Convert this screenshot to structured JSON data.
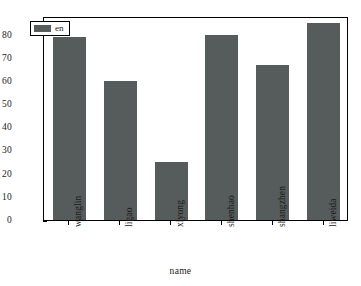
{
  "chart_data": {
    "type": "bar",
    "title": "",
    "xlabel": "name",
    "ylabel": "",
    "categories": [
      "wanglin",
      "ligao",
      "xiyong",
      "shenhao",
      "shangzhen",
      "liweida"
    ],
    "values": [
      79,
      60,
      25,
      80,
      67,
      85
    ],
    "series": [
      {
        "name": "en",
        "values": [
          79,
          60,
          25,
          80,
          67,
          85
        ],
        "color": "#565b5b"
      }
    ],
    "ylim": [
      0,
      88
    ],
    "yticks": [
      0,
      10,
      20,
      30,
      40,
      50,
      60,
      70,
      80
    ],
    "ytick_labels": [
      "0",
      "10",
      "20",
      "30",
      "40",
      "50",
      "60",
      "70",
      "80"
    ],
    "xtick_rotation": 90,
    "grid": false,
    "legend": {
      "position": "upper-left-inside",
      "entries": [
        {
          "label": "en",
          "color": "#565b5b"
        }
      ]
    },
    "background_color": "#ffffff",
    "frame_color": "#000000"
  }
}
